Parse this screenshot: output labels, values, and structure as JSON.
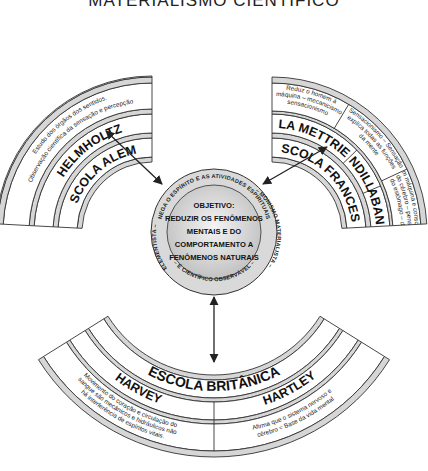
{
  "title": "MATERIALISMO CIENTÍFICO",
  "center": {
    "objective_lines": [
      "OBJETIVO:",
      "REDUZIR OS FENÔMENOS",
      "MENTAIS E DO",
      "COMPORTAMENTO A",
      "FENÔMENOS NATURAIS"
    ],
    "ring_text_top": "NEGA O ESPÍRITO E AS ATIVIDADES ESPIRITUAIS",
    "ring_text_right": "– MONISMO MATERIALISTA –",
    "ring_text_bottom": "– É CIENTÍFICO OBSERVÁVEL –",
    "ring_text_left": "ELEMENTISTA –"
  },
  "schools": {
    "german": {
      "name": "ESCOLA ALEMÃ",
      "thinkers": [
        {
          "name": "HELMHOLTZ",
          "notes": [
            "Estudo dos órgãos dos sentidos.",
            "Observação científica da sensação e percepção"
          ]
        }
      ]
    },
    "french": {
      "name": "ESCOLA FRANCESA",
      "thinkers": [
        {
          "name": "LA METTRIE",
          "notes": [
            "Reduz o homem à",
            "máquina – mecanicismo",
            "sensacionismo"
          ]
        },
        {
          "name": "CONDILLAC",
          "notes": [
            "Sensacionismo – Sensação",
            "explica todas as funções",
            "da mente"
          ]
        },
        {
          "name": "CABANIS",
          "notes": [
            "Homem máquina e consciência",
            "Função do cérebro – pensamento",
            "Função do estômago – digestão"
          ]
        }
      ]
    },
    "british": {
      "name": "ESCOLA BRITÂNICA",
      "thinkers": [
        {
          "name": "HARVEY",
          "notes": [
            "Movimento do coração e circulação do",
            "sangue são mecânicos e hidráulicos não",
            "há interferência de espíritos vitais."
          ]
        },
        {
          "name": "HARTLEY",
          "notes": [
            "Afirma que o sistema nervoso e",
            "cérebro = Base da vida mental"
          ]
        }
      ]
    }
  }
}
